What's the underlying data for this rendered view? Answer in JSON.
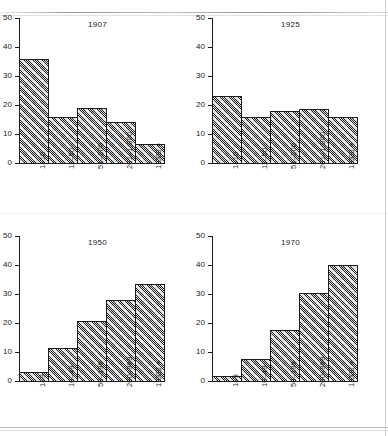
{
  "figure": {
    "background": "#ffffff",
    "ink": "#1d1d1d",
    "bar_fill": "#b3b3b3"
  },
  "chart_data": [
    {
      "type": "bar",
      "title": "1907",
      "categories": [
        "1–10",
        "11–50",
        "51–200",
        "201–1,000",
        "1,000 +"
      ],
      "values": [
        36,
        16,
        19,
        14,
        6.7
      ],
      "xlabel": "",
      "ylabel": "",
      "ylim": [
        0,
        50
      ],
      "yticks": [
        0,
        10,
        20,
        30,
        40,
        50
      ],
      "grid": false,
      "legend": "none",
      "style": "histogram, contiguous hatched bars"
    },
    {
      "type": "bar",
      "title": "1925",
      "categories": [
        "1–10",
        "11–50",
        "51–200",
        "201–1,000",
        "1,000 +"
      ],
      "values": [
        23,
        16,
        18,
        18.5,
        15.7
      ],
      "xlabel": "",
      "ylabel": "",
      "ylim": [
        0,
        50
      ],
      "yticks": [
        0,
        10,
        20,
        30,
        40,
        50
      ],
      "grid": false,
      "legend": "none",
      "style": "histogram, contiguous hatched bars"
    },
    {
      "type": "bar",
      "title": "1950",
      "categories": [
        "1–9",
        "10–49",
        "50–199",
        "200–999",
        "1,000 +"
      ],
      "values": [
        3,
        11.3,
        20.7,
        28,
        33.5
      ],
      "xlabel": "",
      "ylabel": "",
      "ylim": [
        0,
        50
      ],
      "yticks": [
        0,
        10,
        20,
        30,
        40,
        50
      ],
      "grid": false,
      "legend": "none",
      "style": "histogram, contiguous hatched bars"
    },
    {
      "type": "bar",
      "title": "1970",
      "categories": [
        "1–9",
        "10–49",
        "50–199",
        "200–999",
        "1,000 +"
      ],
      "values": [
        1.7,
        7.7,
        17.7,
        30.5,
        40
      ],
      "xlabel": "",
      "ylabel": "",
      "ylim": [
        0,
        50
      ],
      "yticks": [
        0,
        10,
        20,
        30,
        40,
        50
      ],
      "grid": false,
      "legend": "none",
      "style": "histogram, contiguous hatched bars"
    }
  ]
}
